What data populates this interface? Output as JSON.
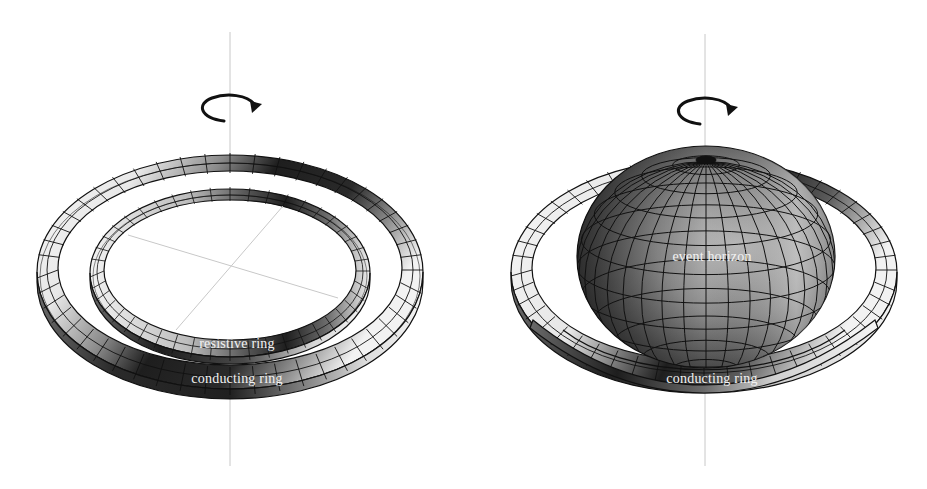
{
  "figure": {
    "left_panel": {
      "title": "Two rings",
      "rotation_icon": "rotation-arrow-icon",
      "labels": {
        "resistive_ring": "resistive ring",
        "conducting_ring": "conducting ring"
      }
    },
    "right_panel": {
      "title": "Black hole with ring",
      "rotation_icon": "rotation-arrow-icon",
      "labels": {
        "event_horizon": "event horizon",
        "conducting_ring": "conducting ring"
      }
    },
    "colors": {
      "background": "#ffffff",
      "axis_line": "#c8c8c8",
      "mesh_line": "#111111",
      "label_text": "#f2f2f2",
      "shade_dark": "#1a1a1a",
      "shade_mid": "#7a7a7a",
      "shade_light": "#f4f4f4"
    }
  }
}
